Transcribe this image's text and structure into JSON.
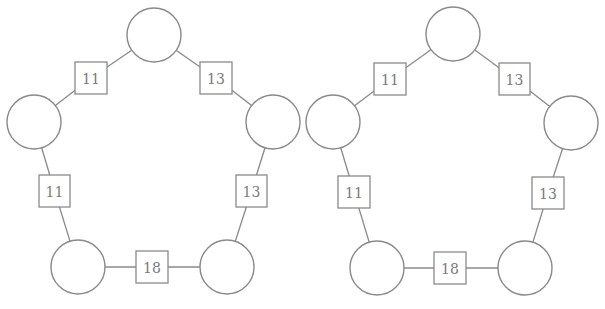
{
  "diagrams": [
    {
      "name": "left-pentagon",
      "offset_x": 0,
      "circles": [
        {
          "id": "top",
          "cx": 154,
          "cy": 35,
          "r": 27,
          "label": ""
        },
        {
          "id": "left",
          "cx": 34,
          "cy": 122,
          "r": 27,
          "label": ""
        },
        {
          "id": "right",
          "cx": 273,
          "cy": 122,
          "r": 27,
          "label": ""
        },
        {
          "id": "bottom-left",
          "cx": 78,
          "cy": 267,
          "r": 27,
          "label": ""
        },
        {
          "id": "bottom-right",
          "cx": 227,
          "cy": 267,
          "r": 27,
          "label": ""
        }
      ],
      "boxes": [
        {
          "id": "top-left",
          "between": [
            "top",
            "left"
          ],
          "x": 75,
          "y": 62,
          "w": 32,
          "h": 32,
          "label": "11"
        },
        {
          "id": "top-right",
          "between": [
            "top",
            "right"
          ],
          "x": 200,
          "y": 62,
          "w": 32,
          "h": 32,
          "label": "13"
        },
        {
          "id": "left",
          "between": [
            "left",
            "bottom-left"
          ],
          "x": 39,
          "y": 175,
          "w": 31,
          "h": 32,
          "label": "11"
        },
        {
          "id": "right",
          "between": [
            "right",
            "bottom-right"
          ],
          "x": 236,
          "y": 175,
          "w": 31,
          "h": 32,
          "label": "13"
        },
        {
          "id": "bottom",
          "between": [
            "bottom-left",
            "bottom-right"
          ],
          "x": 136,
          "y": 251,
          "w": 32,
          "h": 32,
          "label": "18"
        }
      ]
    },
    {
      "name": "right-pentagon",
      "offset_x": 299,
      "circles": [
        {
          "id": "top",
          "cx": 453,
          "cy": 34,
          "r": 27,
          "label": ""
        },
        {
          "id": "left",
          "cx": 333,
          "cy": 122,
          "r": 27,
          "label": ""
        },
        {
          "id": "right",
          "cx": 571,
          "cy": 123,
          "r": 27,
          "label": ""
        },
        {
          "id": "bottom-left",
          "cx": 377,
          "cy": 268,
          "r": 27,
          "label": ""
        },
        {
          "id": "bottom-right",
          "cx": 525,
          "cy": 268,
          "r": 27,
          "label": ""
        }
      ],
      "boxes": [
        {
          "id": "top-left",
          "between": [
            "top",
            "left"
          ],
          "x": 374,
          "y": 63,
          "w": 32,
          "h": 32,
          "label": "11"
        },
        {
          "id": "top-right",
          "between": [
            "top",
            "right"
          ],
          "x": 499,
          "y": 63,
          "w": 31,
          "h": 32,
          "label": "13"
        },
        {
          "id": "left",
          "between": [
            "left",
            "bottom-left"
          ],
          "x": 338,
          "y": 176,
          "w": 32,
          "h": 32,
          "label": "11"
        },
        {
          "id": "right",
          "between": [
            "right",
            "bottom-right"
          ],
          "x": 532,
          "y": 177,
          "w": 32,
          "h": 32,
          "label": "13"
        },
        {
          "id": "bottom",
          "between": [
            "bottom-left",
            "bottom-right"
          ],
          "x": 434,
          "y": 252,
          "w": 32,
          "h": 32,
          "label": "18"
        }
      ]
    }
  ],
  "colors": {
    "stroke": "#8a8a8a",
    "text": "#7a7a7a",
    "background": "#ffffff"
  }
}
